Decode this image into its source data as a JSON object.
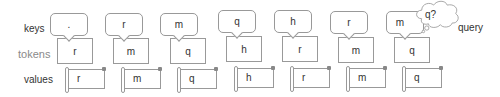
{
  "row_labels": {
    "keys": "keys",
    "tokens": "tokens",
    "values": "values"
  },
  "columns": [
    {
      "key": ".",
      "token": "r",
      "value": "r"
    },
    {
      "key": "r",
      "token": "m",
      "value": "m"
    },
    {
      "key": "m",
      "token": "q",
      "value": "q"
    },
    {
      "key": "q",
      "token": "h",
      "value": "h"
    },
    {
      "key": "h",
      "token": "r",
      "value": "r"
    },
    {
      "key": "r",
      "token": "m",
      "value": "m"
    },
    {
      "key": "m",
      "token": "q",
      "value": "q"
    }
  ],
  "query": {
    "bubble_text": "q?",
    "label": "query"
  },
  "colors": {
    "stroke": "#999999",
    "text": "#333333",
    "tokens_label": "#8a8a8a"
  }
}
